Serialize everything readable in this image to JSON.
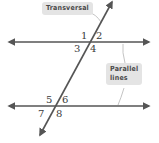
{
  "diagram": {
    "callouts": {
      "transversal": "Transversal",
      "parallel_line1": "Parallel",
      "parallel_line2": "lines"
    },
    "angle_labels": [
      "1",
      "2",
      "3",
      "4",
      "5",
      "6",
      "7",
      "8"
    ],
    "colors": {
      "line": "#555555",
      "callout_bg": "#e4e4e4",
      "leader": "#bbbbbb",
      "text": "#3a3a3a"
    }
  }
}
